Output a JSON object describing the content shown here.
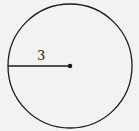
{
  "figure": {
    "shape": "circle",
    "radius_label": "3",
    "stroke_color": "#1a1a1a",
    "background": "#f2f2f0"
  }
}
